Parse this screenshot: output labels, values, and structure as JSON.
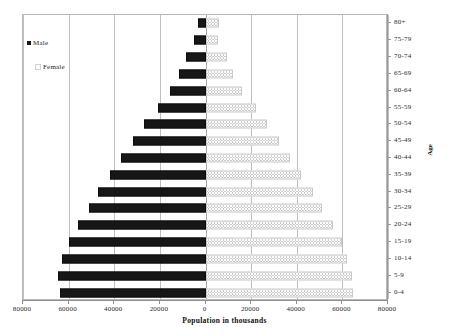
{
  "chart_data": {
    "type": "bar",
    "subtype": "population-pyramid",
    "title": "",
    "xlabel": "Population in thousands",
    "ylabel": "Age",
    "categories": [
      "0-4",
      "5-9",
      "10-14",
      "15-19",
      "20-24",
      "25-29",
      "30-34",
      "35-39",
      "40-44",
      "45-49",
      "50-54",
      "55-59",
      "60-64",
      "65-69",
      "70-74",
      "75-79",
      "80+"
    ],
    "category_order_top_to_bottom": [
      "80+",
      "75-79",
      "70-74",
      "65-69",
      "60-64",
      "55-59",
      "50-54",
      "45-49",
      "40-44",
      "35-39",
      "30-34",
      "25-29",
      "20-24",
      "15-19",
      "10-14",
      "5-9",
      "0-4"
    ],
    "series": [
      {
        "name": "Male",
        "direction": "left",
        "color": "#171717",
        "values": [
          64000,
          64500,
          63000,
          60000,
          56000,
          51000,
          47000,
          42000,
          37000,
          32000,
          27000,
          21000,
          15500,
          11500,
          8500,
          5000,
          3500
        ]
      },
      {
        "name": "Female",
        "direction": "right",
        "color": "#fdfdfd",
        "values": [
          64500,
          64000,
          62000,
          60000,
          56000,
          51000,
          47000,
          42000,
          37000,
          32000,
          27000,
          22000,
          16000,
          12000,
          9500,
          5500,
          6000
        ]
      }
    ],
    "xlim": [
      -80000,
      80000
    ],
    "xticks": [
      -80000,
      -60000,
      -40000,
      -20000,
      0,
      20000,
      40000,
      60000,
      80000
    ],
    "xticklabels": [
      "80000",
      "60000",
      "40000",
      "20000",
      "0",
      "20000",
      "40000",
      "60000",
      "80000"
    ],
    "grid": true,
    "grid_axis": "x",
    "legend_position": "upper-left",
    "y_axis_position": "right"
  },
  "axes": {
    "x_title": "Population in thousands",
    "y_title": "Age"
  },
  "legend": {
    "items": [
      {
        "label": "Male",
        "swatch": "male-swatch"
      },
      {
        "label": "Female",
        "swatch": "female-swatch"
      }
    ]
  },
  "colors": {
    "male": "#171717",
    "female": "#fdfdfd",
    "gridline": "#bfbfbf",
    "axis": "#8f8f8f",
    "frame": "#b9b9b9",
    "text": "#2b2b2b"
  }
}
